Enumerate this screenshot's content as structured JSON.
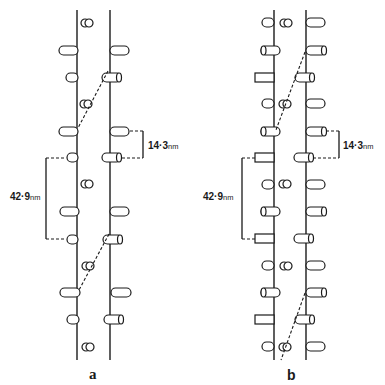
{
  "figure": {
    "panels": [
      {
        "id": "a",
        "label": "a",
        "left_strand_x": 77,
        "right_strand_x": 110,
        "strand_top": 10,
        "strand_bottom": 360,
        "annotations": {
          "short_repeat": "14·3",
          "short_unit": "nm",
          "long_repeat": "42·9",
          "long_unit": "nm"
        }
      },
      {
        "id": "b",
        "label": "b",
        "left_strand_x": 274,
        "right_strand_x": 306,
        "strand_top": 10,
        "strand_bottom": 360,
        "annotations": {
          "short_repeat": "14·3",
          "short_unit": "nm",
          "long_repeat": "42·9",
          "long_unit": "nm"
        }
      }
    ],
    "colors": {
      "line": "#1a1a1a",
      "background": "#ffffff"
    }
  }
}
